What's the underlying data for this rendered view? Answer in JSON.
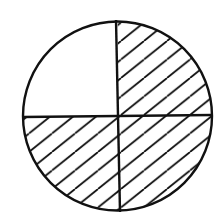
{
  "diagram": {
    "type": "fraction-circle",
    "total_parts": 4,
    "shaded_parts": 3,
    "fraction_shaded": "3/4",
    "quadrants": [
      {
        "position": "top-left",
        "shaded": false
      },
      {
        "position": "top-right",
        "shaded": true
      },
      {
        "position": "bottom-left",
        "shaded": true
      },
      {
        "position": "bottom-right",
        "shaded": true
      }
    ],
    "shading_style": "diagonal-hatch",
    "colors": {
      "stroke": "#111111",
      "background": "#ffffff"
    }
  }
}
